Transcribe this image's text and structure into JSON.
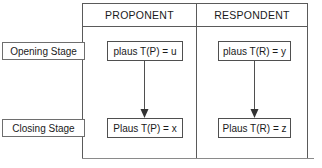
{
  "diagram": {
    "columns": [
      {
        "id": "proponent",
        "label": "PROPONENT"
      },
      {
        "id": "respondent",
        "label": "RESPONDENT"
      }
    ],
    "rows": [
      {
        "id": "opening",
        "label": "Opening Stage"
      },
      {
        "id": "closing",
        "label": "Closing Stage"
      }
    ],
    "cells": {
      "opening": {
        "proponent": "plaus T(P) = u",
        "respondent": "plaus T(R) = y"
      },
      "closing": {
        "proponent": "Plaus T(P) = x",
        "respondent": "Plaus T(R) = z"
      }
    },
    "connectors": [
      {
        "id": "proponent-arrow",
        "from": "plaus T(P) = u",
        "to": "Plaus T(P) = x",
        "direction": "down",
        "style": "solid-line-filled-head"
      },
      {
        "id": "respondent-arrow",
        "from": "plaus T(R) = y",
        "to": "Plaus T(R) = z",
        "direction": "down",
        "style": "solid-line-filled-head"
      }
    ],
    "colors": {
      "frame_stroke": "#5a5a5a",
      "box_stroke": "#4f4f4f",
      "label_stroke": "#6e6e6e",
      "baseline_stroke": "#8a8a8a",
      "text": "#1a1a1a",
      "background": "#ffffff"
    }
  }
}
